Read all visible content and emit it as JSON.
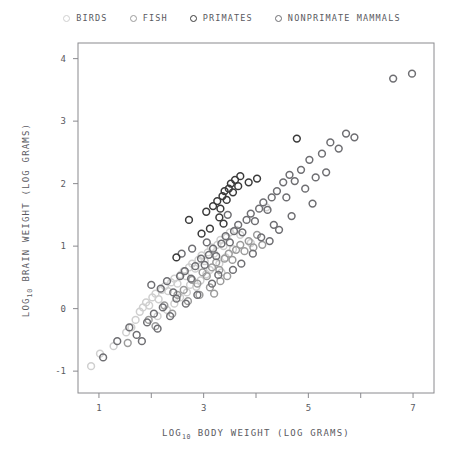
{
  "chart_data": {
    "type": "scatter",
    "title": "",
    "xlabel": "LOG10 BODY WEIGHT (LOG GRAMS)",
    "ylabel": "LOG10 BRAIN WEIGHT (LOG GRAMS)",
    "xlabel_parts": {
      "prefix": "LOG",
      "sub": "10",
      "suffix": " BODY WEIGHT (LOG GRAMS)"
    },
    "ylabel_parts": {
      "prefix": "LOG",
      "sub": "10",
      "suffix": " BRAIN WEIGHT (LOG GRAMS)"
    },
    "xlim": [
      0.6,
      7.4
    ],
    "ylim": [
      -1.35,
      4.25
    ],
    "xticks": [
      1,
      2,
      3,
      4,
      5,
      6,
      7
    ],
    "xtick_labels": [
      "1",
      "",
      "3",
      "",
      "5",
      "",
      "7"
    ],
    "yticks": [
      -1,
      0,
      1,
      2,
      3,
      4
    ],
    "ytick_labels": [
      "-1",
      "0",
      "1",
      "2",
      "3",
      "4"
    ],
    "grid": false,
    "marker": "open-circle",
    "legend_position": "top-center",
    "series": [
      {
        "name": "BIRDS",
        "color": "#cfcfcf",
        "points": [
          [
            0.85,
            -0.92
          ],
          [
            1.02,
            -0.72
          ],
          [
            1.28,
            -0.6
          ],
          [
            1.52,
            -0.38
          ],
          [
            1.62,
            -0.3
          ],
          [
            1.7,
            -0.18
          ],
          [
            1.78,
            -0.05
          ],
          [
            1.84,
            0.02
          ],
          [
            1.9,
            0.1
          ],
          [
            1.96,
            0.05
          ],
          [
            2.02,
            0.18
          ],
          [
            2.08,
            0.24
          ],
          [
            2.14,
            0.15
          ],
          [
            2.2,
            0.3
          ],
          [
            2.26,
            0.36
          ],
          [
            2.32,
            0.28
          ],
          [
            2.38,
            0.42
          ],
          [
            2.44,
            0.48
          ],
          [
            2.5,
            0.4
          ],
          [
            2.56,
            0.54
          ],
          [
            2.62,
            0.6
          ],
          [
            2.66,
            0.52
          ],
          [
            2.72,
            0.66
          ],
          [
            2.78,
            0.72
          ],
          [
            2.84,
            0.64
          ],
          [
            2.9,
            0.78
          ],
          [
            2.96,
            0.85
          ],
          [
            3.02,
            0.76
          ],
          [
            3.08,
            0.9
          ],
          [
            3.14,
            0.98
          ],
          [
            3.2,
            0.88
          ],
          [
            3.26,
            1.02
          ],
          [
            3.32,
            1.1
          ],
          [
            3.38,
            1.0
          ],
          [
            3.44,
            1.14
          ],
          [
            3.5,
            1.22
          ],
          [
            3.05,
            0.55
          ],
          [
            3.12,
            0.62
          ],
          [
            2.86,
            0.35
          ],
          [
            2.94,
            0.45
          ],
          [
            3.3,
            0.72
          ],
          [
            3.42,
            0.82
          ],
          [
            2.55,
            0.18
          ],
          [
            2.68,
            0.26
          ],
          [
            3.62,
            1.26
          ],
          [
            3.7,
            1.18
          ],
          [
            2.44,
            0.08
          ],
          [
            3.9,
            1.05
          ],
          [
            4.2,
            1.62
          ],
          [
            2.3,
            -0.02
          ],
          [
            3.56,
            0.95
          ],
          [
            3.34,
            0.58
          ],
          [
            2.12,
            -0.12
          ],
          [
            2.74,
            0.38
          ]
        ]
      },
      {
        "name": "FISH",
        "color": "#9b9b9b",
        "points": [
          [
            1.55,
            -0.55
          ],
          [
            1.95,
            -0.18
          ],
          [
            2.25,
            0.05
          ],
          [
            2.5,
            0.22
          ],
          [
            2.62,
            0.3
          ],
          [
            2.78,
            0.46
          ],
          [
            2.88,
            0.4
          ],
          [
            2.98,
            0.58
          ],
          [
            3.06,
            0.52
          ],
          [
            3.16,
            0.66
          ],
          [
            3.24,
            0.74
          ],
          [
            3.3,
            0.62
          ],
          [
            3.4,
            0.8
          ],
          [
            3.48,
            0.88
          ],
          [
            3.55,
            0.78
          ],
          [
            3.62,
            0.94
          ],
          [
            3.7,
            1.02
          ],
          [
            3.78,
            0.92
          ],
          [
            3.86,
            1.08
          ],
          [
            3.32,
            0.44
          ],
          [
            2.92,
            0.22
          ],
          [
            3.12,
            0.34
          ],
          [
            4.02,
            1.18
          ],
          [
            3.45,
            0.52
          ],
          [
            2.7,
            0.12
          ],
          [
            3.95,
            0.98
          ],
          [
            2.4,
            -0.08
          ],
          [
            4.12,
            1.02
          ],
          [
            3.2,
            0.24
          ],
          [
            2.08,
            -0.28
          ]
        ]
      },
      {
        "name": "PRIMATES",
        "color": "#3a3a3a",
        "points": [
          [
            2.48,
            0.82
          ],
          [
            2.72,
            1.42
          ],
          [
            3.05,
            1.55
          ],
          [
            3.18,
            1.64
          ],
          [
            3.26,
            1.72
          ],
          [
            3.32,
            1.6
          ],
          [
            3.36,
            1.8
          ],
          [
            3.4,
            1.88
          ],
          [
            3.44,
            1.74
          ],
          [
            3.48,
            1.92
          ],
          [
            3.52,
            2.0
          ],
          [
            3.56,
            1.86
          ],
          [
            3.6,
            2.06
          ],
          [
            3.66,
            1.96
          ],
          [
            3.7,
            2.12
          ],
          [
            3.3,
            1.46
          ],
          [
            3.38,
            1.36
          ],
          [
            3.12,
            1.28
          ],
          [
            4.02,
            2.08
          ],
          [
            4.78,
            2.72
          ],
          [
            3.86,
            2.02
          ],
          [
            2.96,
            1.2
          ]
        ]
      },
      {
        "name": "NONPRIMATE MAMMALS",
        "color": "#6e6e72",
        "points": [
          [
            1.08,
            -0.78
          ],
          [
            1.35,
            -0.52
          ],
          [
            1.58,
            -0.3
          ],
          [
            1.72,
            -0.42
          ],
          [
            1.92,
            -0.22
          ],
          [
            2.05,
            -0.08
          ],
          [
            2.18,
            0.32
          ],
          [
            2.3,
            0.44
          ],
          [
            2.42,
            0.26
          ],
          [
            2.55,
            0.52
          ],
          [
            2.64,
            0.6
          ],
          [
            2.76,
            0.48
          ],
          [
            2.84,
            0.68
          ],
          [
            2.95,
            0.8
          ],
          [
            3.02,
            0.7
          ],
          [
            3.1,
            0.86
          ],
          [
            3.18,
            0.96
          ],
          [
            3.24,
            0.84
          ],
          [
            3.34,
            1.04
          ],
          [
            3.42,
            1.16
          ],
          [
            3.5,
            1.06
          ],
          [
            3.58,
            1.24
          ],
          [
            3.66,
            1.34
          ],
          [
            3.74,
            1.22
          ],
          [
            3.82,
            1.42
          ],
          [
            3.9,
            1.52
          ],
          [
            3.98,
            1.4
          ],
          [
            4.06,
            1.6
          ],
          [
            4.14,
            1.7
          ],
          [
            4.22,
            1.58
          ],
          [
            4.3,
            1.78
          ],
          [
            4.4,
            1.88
          ],
          [
            4.52,
            2.02
          ],
          [
            4.64,
            2.14
          ],
          [
            4.74,
            2.04
          ],
          [
            4.86,
            2.22
          ],
          [
            5.02,
            2.38
          ],
          [
            5.14,
            2.1
          ],
          [
            5.26,
            2.48
          ],
          [
            5.42,
            2.66
          ],
          [
            5.58,
            2.56
          ],
          [
            5.72,
            2.8
          ],
          [
            5.88,
            2.74
          ],
          [
            6.62,
            3.68
          ],
          [
            6.98,
            3.76
          ],
          [
            2.22,
            0.02
          ],
          [
            2.48,
            0.16
          ],
          [
            3.28,
            0.54
          ],
          [
            4.44,
            1.26
          ],
          [
            4.68,
            1.48
          ],
          [
            3.94,
            0.88
          ],
          [
            4.26,
            1.08
          ],
          [
            2.88,
            0.22
          ],
          [
            3.72,
            0.72
          ],
          [
            5.08,
            1.68
          ],
          [
            4.94,
            1.92
          ],
          [
            2.66,
            0.08
          ],
          [
            3.16,
            0.4
          ],
          [
            3.56,
            0.62
          ],
          [
            4.34,
            1.34
          ],
          [
            2.36,
            -0.12
          ],
          [
            1.82,
            -0.52
          ],
          [
            2.12,
            -0.32
          ],
          [
            4.58,
            1.78
          ],
          [
            5.34,
            2.18
          ],
          [
            2.0,
            0.38
          ],
          [
            2.58,
            0.88
          ],
          [
            3.06,
            1.06
          ],
          [
            2.78,
            0.96
          ],
          [
            3.46,
            1.5
          ],
          [
            4.1,
            1.14
          ]
        ]
      }
    ]
  },
  "legend": {
    "entries": [
      {
        "label": "BIRDS"
      },
      {
        "label": "FISH"
      },
      {
        "label": "PRIMATES"
      },
      {
        "label": "NONPRIMATE MAMMALS"
      }
    ]
  },
  "axes": {
    "frame_color": "#8a8a8e",
    "text_color": "#5a5a5f"
  }
}
